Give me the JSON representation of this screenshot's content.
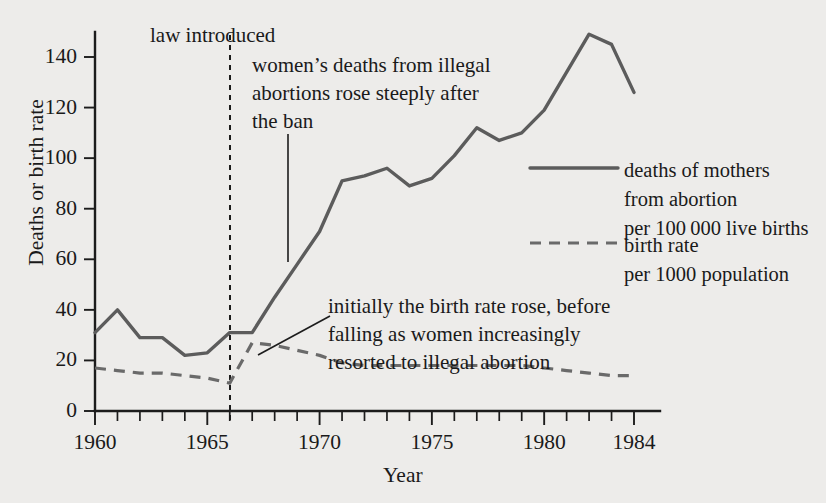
{
  "chart_data": {
    "type": "line",
    "title": "",
    "xlabel": "Year",
    "ylabel": "Deaths or birth rate",
    "xlim": [
      1960,
      1984
    ],
    "ylim": [
      0,
      150
    ],
    "yticks": [
      0,
      20,
      40,
      60,
      80,
      100,
      120,
      140
    ],
    "ytick_labels": [
      "0",
      "20",
      "40",
      "60",
      "80",
      "100",
      "120",
      "140"
    ],
    "xticks": [
      1960,
      1961,
      1962,
      1963,
      1964,
      1965,
      1966,
      1967,
      1968,
      1969,
      1970,
      1971,
      1972,
      1973,
      1974,
      1975,
      1976,
      1977,
      1978,
      1979,
      1980,
      1981,
      1982,
      1983,
      1984
    ],
    "xtick_labels_shown": [
      "1960",
      "1965",
      "1970",
      "1975",
      "1980",
      "1984"
    ],
    "xtick_labels_shown_years": [
      1960,
      1965,
      1970,
      1975,
      1980,
      1984
    ],
    "grid": false,
    "legend_position": "right-middle",
    "x": [
      1960,
      1961,
      1962,
      1963,
      1964,
      1965,
      1966,
      1967,
      1968,
      1969,
      1970,
      1971,
      1972,
      1973,
      1974,
      1975,
      1976,
      1977,
      1978,
      1979,
      1980,
      1981,
      1982,
      1983,
      1984
    ],
    "series": [
      {
        "name": "deaths of mothers from abortion per 100 000 live births",
        "style": "solid",
        "color": "#5c5c5c",
        "values": [
          31,
          40,
          29,
          29,
          22,
          23,
          31,
          31,
          45,
          58,
          71,
          91,
          93,
          96,
          89,
          92,
          101,
          112,
          107,
          110,
          119,
          134,
          149,
          145,
          126
        ]
      },
      {
        "name": "birth rate per 1000 population",
        "style": "dashed",
        "color": "#6a6a6a",
        "values": [
          17,
          16,
          15,
          15,
          14,
          13,
          11,
          27,
          26,
          24,
          22,
          19,
          18,
          18,
          18,
          18,
          18,
          18,
          18,
          18,
          17,
          16,
          15,
          14,
          14
        ]
      }
    ],
    "annotations": [
      {
        "id": "law-introduced",
        "text": "law introduced",
        "at_year": 1966,
        "kind": "vertical-dashed-line-label"
      },
      {
        "id": "deaths-note",
        "text": "women's deaths from illegal\nabortions rose steeply after\nthe ban",
        "kind": "callout-with-leader",
        "points_to_year": 1968
      },
      {
        "id": "birth-rate-note",
        "text": "initially the birth rate rose, before\nfalling as women increasingly\nresorted to illegal abortion",
        "kind": "callout-with-leader",
        "points_to_year": 1967
      }
    ]
  },
  "axis": {
    "y_title": "Deaths or birth rate",
    "x_title": "Year",
    "y_tick_labels": [
      "140",
      "120",
      "100",
      "80",
      "60",
      "40",
      "20",
      "0"
    ],
    "x_tick_labels": [
      "1960",
      "1965",
      "1970",
      "1975",
      "1980",
      "1984"
    ]
  },
  "annotations": {
    "law_introduced": "law introduced",
    "deaths_note_line1": "women’s deaths from illegal",
    "deaths_note_line2": "abortions rose steeply after",
    "deaths_note_line3": "the ban",
    "birth_note_line1": "initially the birth rate rose, before",
    "birth_note_line2": "falling as women increasingly",
    "birth_note_line3": "resorted to illegal abortion"
  },
  "legend": {
    "solid_line1": "deaths of mothers",
    "solid_line2": "from abortion",
    "solid_line3": "per 100 000 live births",
    "dashed_line1": "birth rate",
    "dashed_line2": "per 1000 population"
  },
  "colors": {
    "background": "#edecea",
    "ink": "#1c1c1c",
    "series_solid": "#5c5c5c",
    "series_dashed": "#6a6a6a"
  }
}
